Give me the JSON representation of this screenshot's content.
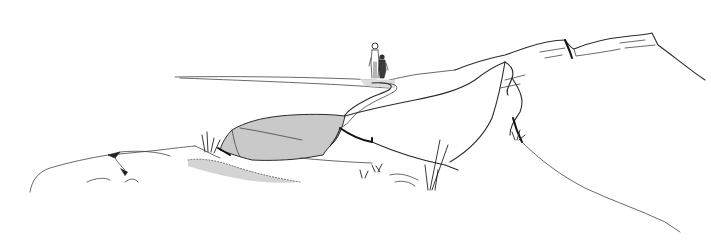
{
  "scene": {
    "description": "Pen-and-ink line drawing of a rocky coastal outcrop with a path leading to two figures standing on a plateau",
    "colors": {
      "background": "#ffffff",
      "ink": "#2a2a2a",
      "shaded_rock": "#c9c9c9",
      "path_fill": "#dcdcdc",
      "gravel": "#9a9a9a"
    },
    "elements": [
      "horizon-plateau",
      "two-figures",
      "winding-path",
      "shaded-boulder",
      "gravel-patch",
      "left-rocks",
      "right-rock-ridge",
      "grass-tufts"
    ]
  }
}
